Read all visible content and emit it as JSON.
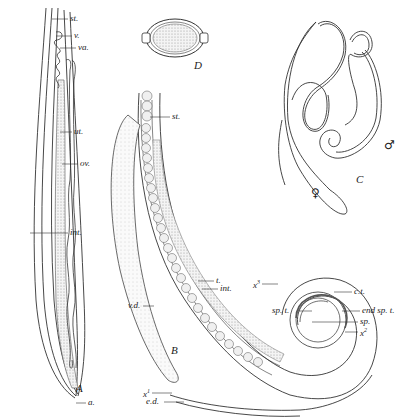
{
  "figure": {
    "panels": [
      {
        "id": "A",
        "label": "A",
        "description": "anterior end of female worm"
      },
      {
        "id": "B",
        "label": "B",
        "description": "posterior end of male worm"
      },
      {
        "id": "C",
        "label": "C",
        "description": "male and female worms, whole"
      },
      {
        "id": "D",
        "label": "D",
        "description": "egg"
      }
    ],
    "panel_a": {
      "label": "A",
      "labels": {
        "st": "st.",
        "v": "v.",
        "va": "va.",
        "ut": "ut.",
        "ov": "ov.",
        "int": "int.",
        "a": "a."
      }
    },
    "panel_b": {
      "label": "B",
      "labels": {
        "st": "st.",
        "t": "t.",
        "int": "int.",
        "x3": "x",
        "x3_sup": "3",
        "ct": "c.t.",
        "sp_t": "sp. t.",
        "end_sp_t": "end sp. t.",
        "sp": "sp.",
        "x2": "x",
        "x2_sup": "2",
        "vd": "v.d.",
        "x1": "x",
        "x1_sup": "1",
        "ed": "e.d."
      }
    },
    "panel_c": {
      "label": "C",
      "female_symbol": "♀",
      "male_symbol": "♂"
    },
    "panel_d": {
      "label": "D"
    }
  }
}
